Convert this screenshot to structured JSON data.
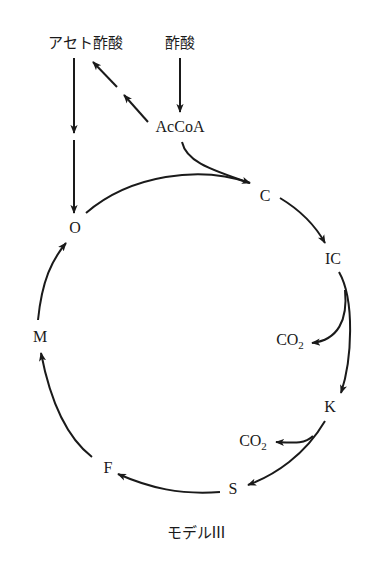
{
  "diagram": {
    "caption": "モデルIII",
    "nodes": {
      "acetoacetate": "アセト酢酸",
      "acetate": "酢酸",
      "accoa": "AcCoA",
      "c": "C",
      "ic": "IC",
      "co2_upper_main": "CO",
      "co2_upper_sub": "2",
      "k": "K",
      "co2_lower_main": "CO",
      "co2_lower_sub": "2",
      "s": "S",
      "f": "F",
      "m": "M",
      "o": "O"
    },
    "edges": [
      {
        "from": "酢酸",
        "to": "AcCoA"
      },
      {
        "from": "AcCoA",
        "to": "アセト酢酸",
        "style": "double-arrow"
      },
      {
        "from": "アセト酢酸",
        "to": "O"
      },
      {
        "from": "AcCoA",
        "to": "C"
      },
      {
        "from": "O",
        "to": "C"
      },
      {
        "from": "C",
        "to": "IC"
      },
      {
        "from": "IC",
        "to": "CO2"
      },
      {
        "from": "IC",
        "to": "K"
      },
      {
        "from": "K",
        "to": "CO2"
      },
      {
        "from": "K",
        "to": "S"
      },
      {
        "from": "S",
        "to": "F"
      },
      {
        "from": "F",
        "to": "M"
      },
      {
        "from": "M",
        "to": "O"
      }
    ],
    "colors": {
      "line": "#1a1a1a",
      "background": "#ffffff"
    }
  }
}
